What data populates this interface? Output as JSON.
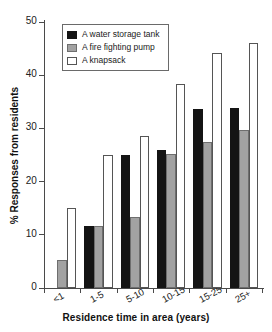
{
  "chart_data": {
    "type": "bar",
    "title": "",
    "xlabel": "Residence time in area (years)",
    "ylabel": "% Responses from residents",
    "categories": [
      "<1",
      "1-5",
      "5-10",
      "10-15",
      "15-25",
      "25+"
    ],
    "ylim": [
      0,
      50
    ],
    "yticks": [
      0,
      10,
      20,
      30,
      40,
      50
    ],
    "grid": false,
    "legend_position": "top-left-inside",
    "series": [
      {
        "name": "A water storage tank",
        "color": "#141414",
        "values": [
          0,
          11.6,
          25.0,
          26.0,
          33.6,
          33.8
        ]
      },
      {
        "name": "A fire fighting pump",
        "color": "#a2a2a2",
        "values": [
          5.3,
          11.6,
          13.4,
          25.1,
          27.5,
          29.7
        ]
      },
      {
        "name": "A knapsack",
        "color": "#ffffff",
        "values": [
          15.0,
          25.0,
          28.5,
          38.3,
          44.2,
          46.0
        ]
      }
    ]
  }
}
